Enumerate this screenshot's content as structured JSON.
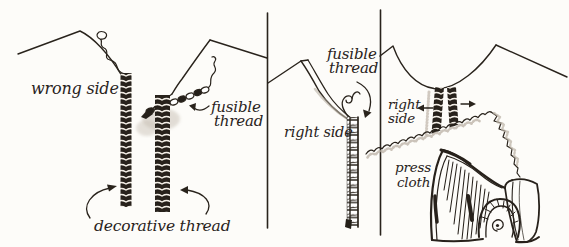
{
  "figure": {
    "ink_color": "#29231c",
    "paper_color": "#fdfcf9",
    "shade_color": "#b9b0a4"
  },
  "panels": [
    {
      "id": "step-1-wrong-side",
      "labels": {
        "wrong_side": "wrong side",
        "fusible_1": "fusible",
        "fusible_2": "thread",
        "decorative_thread": "decorative thread"
      }
    },
    {
      "id": "step-2-right-side",
      "labels": {
        "fusible_1": "fusible",
        "fusible_2": "thread",
        "right_side": "right side"
      }
    },
    {
      "id": "step-3-pressing",
      "labels": {
        "right_1": "right",
        "right_2": "side",
        "press_1": "press",
        "press_2": "cloth"
      }
    }
  ]
}
